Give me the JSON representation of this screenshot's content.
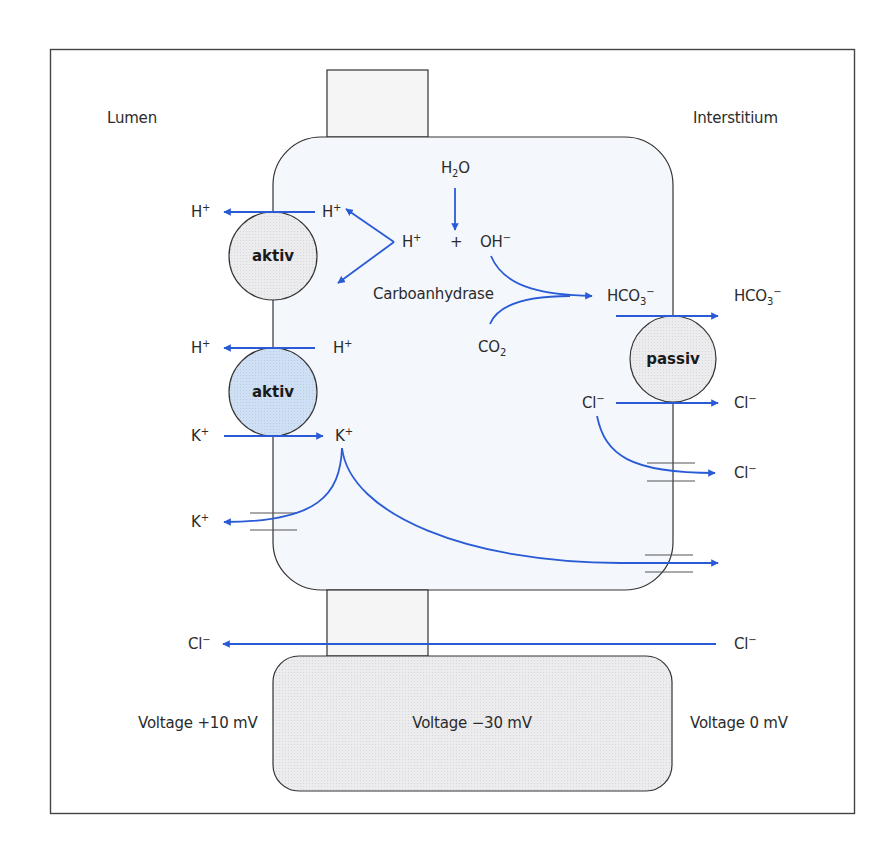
{
  "regions": {
    "lumen": "Lumen",
    "interstitium": "Interstitium"
  },
  "colors": {
    "arrow": "#2a5bd7",
    "cell_fill": "#f4f7fc",
    "active_pump_1_fill": "#e9eaec",
    "active_pump_2_fill": "#c9dcf2",
    "passive_carrier_fill": "#e9eaec",
    "voltage_box_fill": "#eeeff1",
    "outline": "#333333"
  },
  "transporters": {
    "active_1": {
      "label": "aktiv"
    },
    "active_2": {
      "label": "aktiv"
    },
    "passive": {
      "label": "passiv"
    }
  },
  "reaction": {
    "water": {
      "base": "H",
      "sub": "2",
      "tail": "O"
    },
    "proton": {
      "base": "H",
      "sup": "+"
    },
    "plus": "+",
    "hydroxide": {
      "base": "OH",
      "sup": "−"
    },
    "enzyme": "Carboanhydrase",
    "co2": {
      "base": "CO",
      "sub": "2"
    },
    "bicarbonate_in": {
      "base": "HCO",
      "sub": "3",
      "sup": "−"
    }
  },
  "ions": {
    "h_lumen_1": {
      "base": "H",
      "sup": "+"
    },
    "h_cell_1": {
      "base": "H",
      "sup": "+"
    },
    "h_lumen_2": {
      "base": "H",
      "sup": "+"
    },
    "h_cell_2": {
      "base": "H",
      "sup": "+"
    },
    "k_lumen_in": {
      "base": "K",
      "sup": "+"
    },
    "k_cell": {
      "base": "K",
      "sup": "+"
    },
    "k_lumen_out": {
      "base": "K",
      "sup": "+"
    },
    "hco3_interstitium": {
      "base": "HCO",
      "sub": "3",
      "sup": "−"
    },
    "cl_cell": {
      "base": "Cl",
      "sup": "−"
    },
    "cl_interstitium_1": {
      "base": "Cl",
      "sup": "−"
    },
    "cl_interstitium_2": {
      "base": "Cl",
      "sup": "−"
    },
    "cl_paracellular_right": {
      "base": "Cl",
      "sup": "−"
    },
    "cl_paracellular_left": {
      "base": "Cl",
      "sup": "−"
    }
  },
  "voltages": {
    "lumen": "Voltage +10 mV",
    "cell": "Voltage −30 mV",
    "interstitium": "Voltage 0 mV"
  }
}
